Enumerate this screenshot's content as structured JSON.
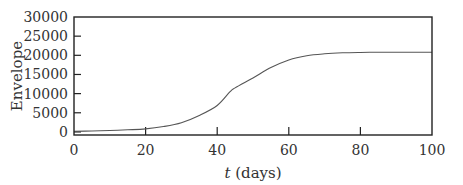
{
  "chart_data": {
    "type": "line",
    "title": "",
    "xlabel": "t (days)",
    "xlabel_parts": {
      "var": "t",
      "unit": " (days)"
    },
    "ylabel": "Envelope",
    "xlim": [
      0,
      100
    ],
    "ylim": [
      -800,
      30000
    ],
    "xticks": [
      0,
      20,
      40,
      60,
      80,
      100
    ],
    "xtick_labels": [
      "0",
      "20",
      "40",
      "60",
      "80",
      "100"
    ],
    "yticks": [
      0,
      5000,
      10000,
      15000,
      20000,
      25000,
      30000
    ],
    "ytick_labels": [
      "0",
      "5000",
      "10000",
      "15000",
      "20000",
      "25000",
      "30000"
    ],
    "grid": false,
    "legend": null,
    "series": [
      {
        "name": "Envelope",
        "color": "#555555",
        "x": [
          0,
          5,
          10,
          15,
          20,
          25,
          30,
          35,
          40,
          43.6,
          45,
          50,
          55,
          60,
          65,
          70,
          75,
          80,
          85,
          90,
          95,
          100
        ],
        "y": [
          150,
          250,
          380,
          560,
          800,
          1400,
          2400,
          4300,
          6900,
          10500,
          11500,
          14100,
          16800,
          18800,
          19900,
          20400,
          20650,
          20750,
          20800,
          20800,
          20800,
          20800
        ]
      }
    ]
  }
}
